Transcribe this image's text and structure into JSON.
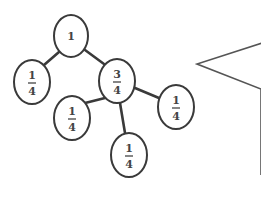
{
  "diagram": {
    "type": "fraction-tree",
    "colors": {
      "stroke": "#3a3a3a",
      "text": "#444444",
      "background": "#ffffff"
    },
    "nodes": [
      {
        "id": "root",
        "label": "1",
        "numerator": "1",
        "denominator": "",
        "cx": 71,
        "cy": 36,
        "rx": 17,
        "ry": 21
      },
      {
        "id": "left-quarter",
        "label": "1/4",
        "numerator": "1",
        "denominator": "4",
        "cx": 32,
        "cy": 82,
        "rx": 18,
        "ry": 22
      },
      {
        "id": "three-quarters",
        "label": "3/4",
        "numerator": "3",
        "denominator": "4",
        "cx": 117,
        "cy": 81,
        "rx": 18,
        "ry": 22
      },
      {
        "id": "right-quarter",
        "label": "1/4",
        "numerator": "1",
        "denominator": "4",
        "cx": 176,
        "cy": 107,
        "rx": 18,
        "ry": 22
      },
      {
        "id": "bottom-left-quarter",
        "label": "1/4",
        "numerator": "1",
        "denominator": "4",
        "cx": 72,
        "cy": 118,
        "rx": 18,
        "ry": 22
      },
      {
        "id": "bottom-quarter",
        "label": "1/4",
        "numerator": "1",
        "denominator": "4",
        "cx": 129,
        "cy": 155,
        "rx": 18,
        "ry": 22
      }
    ],
    "edges": [
      {
        "from": "root",
        "to": "left-quarter",
        "x1": 59,
        "y1": 52,
        "x2": 44,
        "y2": 65
      },
      {
        "from": "root",
        "to": "three-quarters",
        "x1": 85,
        "y1": 50,
        "x2": 104,
        "y2": 64
      },
      {
        "from": "three-quarters",
        "to": "right-quarter",
        "x1": 135,
        "y1": 88,
        "x2": 159,
        "y2": 98
      },
      {
        "from": "three-quarters",
        "to": "bottom-left-quarter",
        "x1": 105,
        "y1": 98,
        "x2": 85,
        "y2": 103
      },
      {
        "from": "three-quarters",
        "to": "bottom-quarter",
        "x1": 120,
        "y1": 103,
        "x2": 125,
        "y2": 133
      }
    ],
    "speech_bubble": {
      "points": "262,43 197,64 261,89 261,175",
      "text": ""
    }
  }
}
